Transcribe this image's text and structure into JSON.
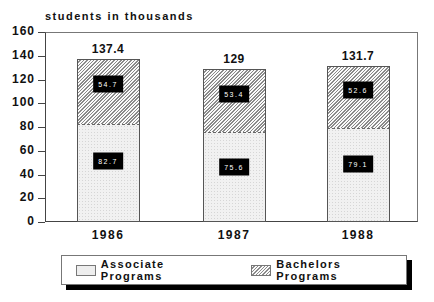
{
  "chart_data": {
    "type": "bar",
    "stacked": true,
    "title": "",
    "ylabel": "students in thousands",
    "xlabel": "",
    "categories": [
      "1986",
      "1987",
      "1988"
    ],
    "series": [
      {
        "name": "Associate Programs",
        "values": [
          82.7,
          75.6,
          79.1
        ],
        "labels": [
          "82.7",
          "75.6",
          "79.1"
        ]
      },
      {
        "name": "Bachelors Programs",
        "values": [
          54.7,
          53.4,
          52.6
        ],
        "labels": [
          "54.7",
          "53.4",
          "52.6"
        ]
      }
    ],
    "totals": [
      "137.4",
      "129",
      "131.7"
    ],
    "ylim": [
      0,
      160
    ],
    "yticks": [
      "0",
      "20",
      "40",
      "60",
      "80",
      "100",
      "120",
      "140",
      "160"
    ],
    "grid": false,
    "legend_position": "bottom"
  },
  "legend": {
    "items": [
      {
        "label": "Associate Programs"
      },
      {
        "label": "Bachelors Programs"
      }
    ]
  }
}
